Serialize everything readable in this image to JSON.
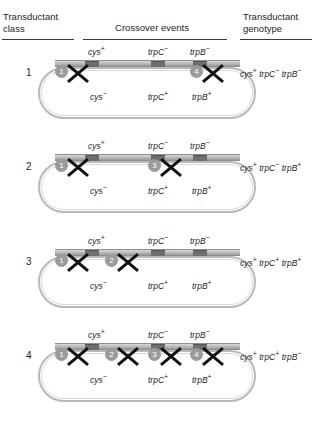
{
  "figure": {
    "type": "genetics-transduction-crossover-diagram",
    "headers": {
      "class_col": "Transductant class",
      "class_col_line1": "Transductant",
      "class_col_line2": "class",
      "crossover_col": "Crossover events",
      "genotype_col": "Transductant genotype",
      "genotype_col_line1": "Transductant",
      "genotype_col_line2": "genotype"
    },
    "donor_gene_labels": [
      {
        "gene": "cys",
        "sup": "+",
        "x": 88
      },
      {
        "gene": "trpC",
        "sup": "−",
        "x": 148
      },
      {
        "gene": "trpB",
        "sup": "−",
        "x": 190
      }
    ],
    "recipient_gene_labels": [
      {
        "gene": "cys",
        "sup": "−",
        "x": 90
      },
      {
        "gene": "trpC",
        "sup": "+",
        "x": 148
      },
      {
        "gene": "trpB",
        "sup": "+",
        "x": 192
      }
    ],
    "crossover_site_positions": [
      {
        "id": 1,
        "x": 55
      },
      {
        "id": 2,
        "x": 105
      },
      {
        "id": 3,
        "x": 148
      },
      {
        "id": 4,
        "x": 190
      }
    ],
    "gene_block_positions": [
      {
        "left": 30,
        "width": 14
      },
      {
        "left": 96,
        "width": 14
      },
      {
        "left": 138,
        "width": 14
      }
    ],
    "rows": [
      {
        "class_label": "1",
        "crossovers": [
          1,
          4
        ],
        "genotype_plain": "cys+ trpC- trpB-",
        "genotype_parts": [
          {
            "gene": "cys",
            "sup": "+"
          },
          {
            "gene": "trpC",
            "sup": "−"
          },
          {
            "gene": "trpB",
            "sup": "−"
          }
        ]
      },
      {
        "class_label": "2",
        "crossovers": [
          1,
          3
        ],
        "genotype_plain": "cys+ trpC- trpB+",
        "genotype_parts": [
          {
            "gene": "cys",
            "sup": "+"
          },
          {
            "gene": "trpC",
            "sup": "−"
          },
          {
            "gene": "trpB",
            "sup": "+"
          }
        ]
      },
      {
        "class_label": "3",
        "crossovers": [
          1,
          2
        ],
        "genotype_plain": "cys+ trpC+ trpB+",
        "genotype_parts": [
          {
            "gene": "cys",
            "sup": "+"
          },
          {
            "gene": "trpC",
            "sup": "+"
          },
          {
            "gene": "trpB",
            "sup": "+"
          }
        ]
      },
      {
        "class_label": "4",
        "crossovers": [
          1,
          2,
          3,
          4
        ],
        "genotype_plain": "cys+ trpC+ trpB-",
        "genotype_parts": [
          {
            "gene": "cys",
            "sup": "+"
          },
          {
            "gene": "trpC",
            "sup": "+"
          },
          {
            "gene": "trpB",
            "sup": "−"
          }
        ]
      }
    ],
    "colors": {
      "text": "#231f20",
      "rule": "#3a3a3a",
      "badge": "#9b9b9b",
      "x_mark": "#111111",
      "strand": "#bdbdbd",
      "gene_block": "#6e6e6e",
      "plasmid": "#b9b9b9",
      "background": "#ffffff"
    }
  }
}
